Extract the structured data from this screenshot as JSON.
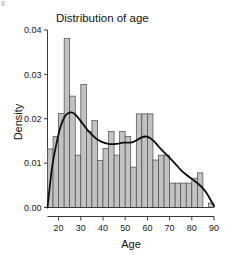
{
  "chart_data": {
    "type": "bar",
    "title": "Distribution of age",
    "xlabel": "Age",
    "ylabel": "Density",
    "xlim": [
      15,
      90
    ],
    "ylim": [
      0.0,
      0.04
    ],
    "grid": false,
    "legend": null,
    "bin_width": 2.5,
    "x_tick_labels": [
      "20",
      "30",
      "40",
      "50",
      "60",
      "70",
      "80",
      "90"
    ],
    "x_tick_values": [
      20,
      30,
      40,
      50,
      60,
      70,
      80,
      90
    ],
    "y_tick_labels": [
      "0.00",
      "0.01",
      "0.02",
      "0.03",
      "0.04"
    ],
    "y_tick_values": [
      0.0,
      0.01,
      0.02,
      0.03,
      0.04
    ],
    "categories": [
      "15.0-17.5",
      "17.5-20.0",
      "20.0-22.5",
      "22.5-25.0",
      "25.0-27.5",
      "27.5-30.0",
      "30.0-32.5",
      "32.5-35.0",
      "35.0-37.5",
      "37.5-40.0",
      "40.0-42.5",
      "42.5-45.0",
      "45.0-47.5",
      "47.5-50.0",
      "50.0-52.5",
      "52.5-55.0",
      "55.0-57.5",
      "57.5-60.0",
      "60.0-62.5",
      "62.5-65.0",
      "65.0-67.5",
      "67.5-70.0",
      "70.0-72.5",
      "72.5-75.0",
      "75.0-77.5",
      "77.5-80.0",
      "80.0-82.5",
      "82.5-85.0",
      "85.0-87.5",
      "87.5-90.0"
    ],
    "values": [
      0.0132,
      0.016,
      0.0212,
      0.0381,
      0.0251,
      0.0118,
      0.0277,
      0.0171,
      0.0196,
      0.0106,
      0.0133,
      0.0171,
      0.0118,
      0.0171,
      0.016,
      0.0091,
      0.0211,
      0.0211,
      0.0211,
      0.0107,
      0.0118,
      0.0118,
      0.0055,
      0.0055,
      0.0055,
      0.0055,
      0.0066,
      0.0078,
      0.0,
      0.001
    ],
    "series": [
      {
        "name": "Histogram (density)",
        "values": [
          0.0132,
          0.016,
          0.0212,
          0.0381,
          0.0251,
          0.0118,
          0.0277,
          0.0171,
          0.0196,
          0.0106,
          0.0133,
          0.0171,
          0.0118,
          0.0171,
          0.016,
          0.0091,
          0.0211,
          0.0211,
          0.0211,
          0.0107,
          0.0118,
          0.0118,
          0.0055,
          0.0055,
          0.0055,
          0.0055,
          0.0066,
          0.0078,
          0.0,
          0.001
        ]
      },
      {
        "name": "Kernel density estimate",
        "type": "line",
        "x": [
          15,
          17,
          19,
          21,
          23,
          25,
          27,
          29,
          31,
          33,
          35,
          37,
          39,
          41,
          43,
          45,
          47,
          49,
          51,
          53,
          55,
          57,
          59,
          61,
          63,
          65,
          67,
          69,
          71,
          73,
          75,
          77,
          79,
          81,
          83,
          85,
          87,
          89,
          90
        ],
        "values": [
          0.0,
          0.0088,
          0.0143,
          0.0184,
          0.0207,
          0.0214,
          0.0212,
          0.0201,
          0.0188,
          0.0175,
          0.0164,
          0.0155,
          0.0149,
          0.0145,
          0.0143,
          0.0143,
          0.0144,
          0.0146,
          0.0146,
          0.0147,
          0.0151,
          0.0157,
          0.016,
          0.0157,
          0.0149,
          0.0138,
          0.0127,
          0.0117,
          0.0107,
          0.0096,
          0.0085,
          0.0076,
          0.0068,
          0.0061,
          0.0053,
          0.0043,
          0.003,
          0.0012,
          0.0003
        ]
      }
    ],
    "colors": {
      "bar_fill": "#c2c2c2",
      "bar_border": "#4a4a4a",
      "curve": "#0d0d0d",
      "axis": "#3a3a3a",
      "text": "#111111",
      "background": "#ffffff"
    }
  }
}
